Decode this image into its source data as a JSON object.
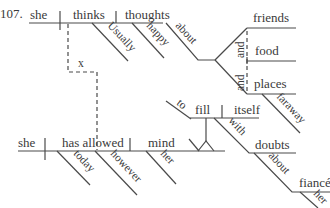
{
  "diagram": {
    "number": "107.",
    "clause1": {
      "subject": "she",
      "verb": "thinks",
      "object": "thoughts",
      "verb_modifier": "Usually",
      "object_modifier": "happy",
      "preposition": "about",
      "compound_objects": [
        "friends",
        "food",
        "places"
      ],
      "conjunctions": [
        "and",
        "and"
      ],
      "places_modifier": "faraway"
    },
    "connector": {
      "label": "x"
    },
    "clause2": {
      "subject": "she",
      "verb": "has allowed",
      "object": "mind",
      "verb_modifiers": [
        "today",
        "however"
      ],
      "object_modifier": "her",
      "infinitive_marker": "to",
      "infinitive_verb": "fill",
      "infinitive_object": "itself",
      "preposition1": "with",
      "prep1_object": "doubts",
      "preposition2": "about",
      "prep2_object": "fiancé",
      "prep2_object_modifier": "her"
    }
  }
}
